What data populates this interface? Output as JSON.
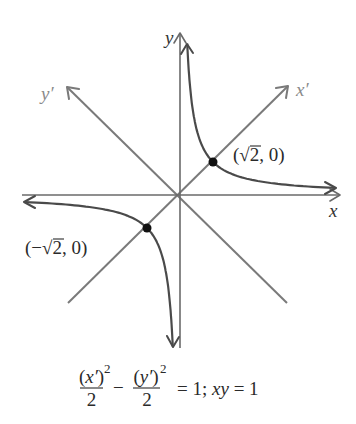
{
  "figure": {
    "axes": {
      "x_label": "x",
      "y_label": "y",
      "x_prime_label": "x′",
      "y_prime_label": "y′"
    },
    "colors": {
      "axis": "#6a6a6a",
      "rotated_axis": "#7a7a7a",
      "curve": "#4a4a4a",
      "point": "#111111",
      "text": "#2a2a2a"
    },
    "curve": {
      "equation": "xy = 1",
      "origin_px": [
        180,
        195
      ],
      "scale_px": 33,
      "x_range": [
        0.218,
        4.7
      ]
    },
    "points": [
      {
        "coords": [
          1,
          1
        ],
        "open": "(",
        "sign": "",
        "radical": "√",
        "radicand": "2",
        "rest": ", 0)"
      },
      {
        "coords": [
          -1,
          -1
        ],
        "open": "(",
        "sign": "−",
        "radical": "√",
        "radicand": "2",
        "rest": ", 0)"
      }
    ],
    "caption": {
      "frac1": {
        "open": "(",
        "var": "x′",
        "close": ")",
        "power": "2",
        "den": "2"
      },
      "minus": "−",
      "frac2": {
        "open": "(",
        "var": "y′",
        "close": ")",
        "power": "2",
        "den": "2"
      },
      "eq1": "= 1; ",
      "xy": "xy",
      "eq2": " = 1"
    }
  }
}
